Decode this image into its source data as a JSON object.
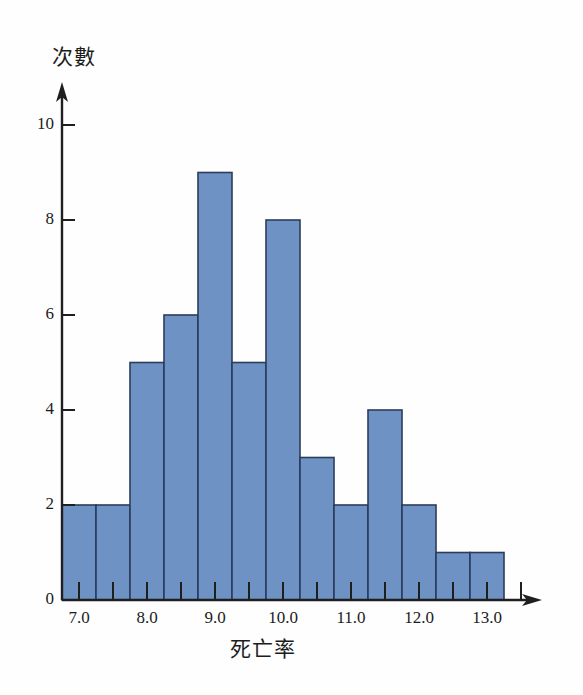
{
  "chart_data": {
    "type": "bar",
    "title": "",
    "subtitle": "",
    "xlabel": "死亡率",
    "ylabel": "次數",
    "categories": [
      "7.0",
      "7.5",
      "8.0",
      "8.5",
      "9.0",
      "9.5",
      "10.0",
      "10.5",
      "11.0",
      "11.5",
      "12.0",
      "12.5",
      "13.0"
    ],
    "x": [
      7.0,
      7.5,
      8.0,
      8.5,
      9.0,
      9.5,
      10.0,
      10.5,
      11.0,
      11.5,
      12.0,
      12.5,
      13.0
    ],
    "values": [
      2,
      2,
      5,
      6,
      9,
      5,
      8,
      3,
      2,
      4,
      2,
      1,
      1
    ],
    "bin_width": 0.5,
    "xlim": [
      6.75,
      13.5
    ],
    "ylim": [
      0,
      11
    ],
    "x_major_ticks": [
      "7.0",
      "8.0",
      "9.0",
      "10.0",
      "11.0",
      "12.0",
      "13.0"
    ],
    "x_major_tick_values": [
      7.0,
      8.0,
      9.0,
      10.0,
      11.0,
      12.0,
      13.0
    ],
    "x_minor_tick_values": [
      7.5,
      8.5,
      9.5,
      10.5,
      11.5,
      12.5,
      13.5
    ],
    "y_ticks": [
      "0",
      "2",
      "4",
      "6",
      "8",
      "10"
    ],
    "y_tick_values": [
      0,
      2,
      4,
      6,
      8,
      10
    ],
    "grid": false,
    "legend": null,
    "legend_position": "none",
    "annotations": [],
    "bar_fill_color": "#6e92c4",
    "bar_edge_color": "#2b3c5c",
    "axis_color": "#1f1f1f",
    "background_color": "#fefefe"
  },
  "axes": {
    "y_axis_title": "次數",
    "x_axis_title": "死亡率"
  }
}
